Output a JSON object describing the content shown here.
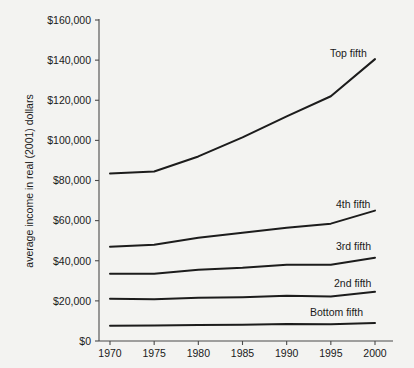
{
  "chart_data": {
    "type": "line",
    "title": "",
    "xlabel": "",
    "ylabel": "average income in real (2001) dollars",
    "x": [
      1970,
      1975,
      1980,
      1985,
      1990,
      1995,
      2000
    ],
    "xtick_labels": [
      "1970",
      "1975",
      "1980",
      "1985",
      "1990",
      "1995",
      "2000"
    ],
    "ytick_labels": [
      "$0",
      "$20,000",
      "$40,000",
      "$60,000",
      "$80,000",
      "$100,000",
      "$120,000",
      "$140,000",
      "$160,000"
    ],
    "ytick_values": [
      0,
      20000,
      40000,
      60000,
      80000,
      100000,
      120000,
      140000,
      160000
    ],
    "xlim": [
      1970,
      2000
    ],
    "ylim": [
      0,
      160000
    ],
    "grid": false,
    "legend_position": "inline-right-of-series",
    "line_color": "#1c1c1c",
    "series": [
      {
        "name": "Top fifth",
        "label": "Top fifth",
        "values": [
          83500,
          84500,
          92000,
          101500,
          112000,
          122000,
          140500
        ]
      },
      {
        "name": "4th fifth",
        "label": "4th fifth",
        "values": [
          47000,
          48000,
          51500,
          54000,
          56500,
          58500,
          65000
        ]
      },
      {
        "name": "3rd fifth",
        "label": "3rd fifth",
        "values": [
          33500,
          33500,
          35500,
          36500,
          38000,
          38000,
          41500
        ]
      },
      {
        "name": "2nd fifth",
        "label": "2nd fifth",
        "values": [
          21000,
          20800,
          21500,
          21800,
          22500,
          22200,
          24500
        ]
      },
      {
        "name": "Bottom fifth",
        "label": "Bottom  fifth",
        "values": [
          7600,
          7700,
          8000,
          8100,
          8500,
          8400,
          9000
        ]
      }
    ],
    "series_label_positions": [
      {
        "name": "Top fifth",
        "x_px": 330,
        "y_px": 57
      },
      {
        "name": "4th fifth",
        "x_px": 336,
        "y_px": 208
      },
      {
        "name": "3rd fifth",
        "x_px": 336,
        "y_px": 250
      },
      {
        "name": "2nd fifth",
        "x_px": 334,
        "y_px": 287
      },
      {
        "name": "Bottom  fifth",
        "x_px": 310,
        "y_px": 316
      }
    ]
  }
}
